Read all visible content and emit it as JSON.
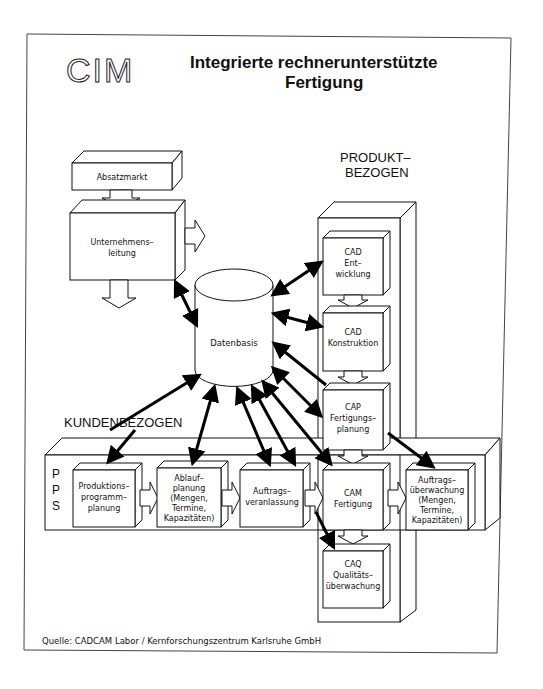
{
  "header": {
    "logo": "CIM",
    "title_line1": "Integrierte rechnerunterstützte",
    "title_line2": "Fertigung"
  },
  "groups": {
    "product_line1": "PRODUKT–",
    "product_line2": "BEZOGEN",
    "customer": "KUNDENBEZOGEN",
    "pps_letters": [
      "P",
      "P",
      "S"
    ]
  },
  "boxes": {
    "absatzmarkt": [
      "Absatzmarkt"
    ],
    "unternehmensleitung": [
      "Unternehmens–",
      "leitung"
    ],
    "datenbasis": [
      "Datenbasis"
    ],
    "cad_entwicklung": [
      "CAD",
      "Ent–",
      "wicklung"
    ],
    "cad_konstruktion": [
      "CAD",
      "Konstruktion"
    ],
    "cap": [
      "CAP",
      "Fertigungs–",
      "planung"
    ],
    "produktionsprogramm": [
      "Produktions–",
      "programm–",
      "planung"
    ],
    "ablaufplanung": [
      "Ablauf–",
      "planung",
      "(Mengen,",
      "Termine,",
      "Kapazitäten)"
    ],
    "auftragsveranlassung": [
      "Auftrags–",
      "veranlassung"
    ],
    "cam": [
      "CAM",
      "Fertigung"
    ],
    "auftragsueberwachung": [
      "Auftrags–",
      "überwachung",
      "(Mengen,",
      "Termine,",
      "Kapazitäten)"
    ],
    "caq": [
      "CAQ",
      "Qualitäts–",
      "überwachung"
    ]
  },
  "footer": {
    "source": "Quelle:  CADCAM Labor  /  Kernforschungszentrum Karlsruhe GmbH"
  }
}
